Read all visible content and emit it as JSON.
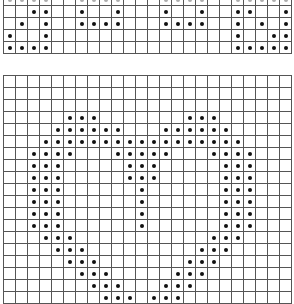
{
  "colors": {
    "grid_line": "#555555",
    "dot": "#111111",
    "background": "#ffffff"
  },
  "top_grid": {
    "columns": 24,
    "rows_visible": 5,
    "cell_size_px": 12,
    "filled_cells": [
      [
        0,
        0
      ],
      [
        0,
        1
      ],
      [
        0,
        2
      ],
      [
        0,
        3
      ],
      [
        0,
        6
      ],
      [
        0,
        7
      ],
      [
        0,
        8
      ],
      [
        0,
        9
      ],
      [
        0,
        13
      ],
      [
        0,
        14
      ],
      [
        0,
        15
      ],
      [
        0,
        16
      ],
      [
        0,
        19
      ],
      [
        0,
        20
      ],
      [
        0,
        21
      ],
      [
        0,
        22
      ],
      [
        0,
        23
      ],
      [
        1,
        2
      ],
      [
        1,
        3
      ],
      [
        1,
        6
      ],
      [
        1,
        9
      ],
      [
        1,
        13
      ],
      [
        1,
        16
      ],
      [
        1,
        19
      ],
      [
        1,
        20
      ],
      [
        1,
        23
      ],
      [
        2,
        1
      ],
      [
        2,
        3
      ],
      [
        2,
        6
      ],
      [
        2,
        7
      ],
      [
        2,
        8
      ],
      [
        2,
        9
      ],
      [
        2,
        13
      ],
      [
        2,
        14
      ],
      [
        2,
        15
      ],
      [
        2,
        16
      ],
      [
        2,
        19
      ],
      [
        2,
        21
      ],
      [
        2,
        23
      ],
      [
        3,
        0
      ],
      [
        3,
        3
      ],
      [
        3,
        19
      ],
      [
        3,
        22
      ],
      [
        3,
        23
      ],
      [
        4,
        0
      ],
      [
        4,
        1
      ],
      [
        4,
        2
      ],
      [
        4,
        3
      ],
      [
        4,
        19
      ],
      [
        4,
        20
      ],
      [
        4,
        21
      ],
      [
        4,
        22
      ],
      [
        4,
        23
      ]
    ]
  },
  "bottom_grid": {
    "columns": 24,
    "rows_visible": 19,
    "cell_size_px": 12,
    "pattern": "heart",
    "filled_cells": [
      [
        3,
        5
      ],
      [
        3,
        6
      ],
      [
        3,
        7
      ],
      [
        3,
        15
      ],
      [
        3,
        16
      ],
      [
        3,
        17
      ],
      [
        4,
        4
      ],
      [
        4,
        5
      ],
      [
        4,
        6
      ],
      [
        4,
        7
      ],
      [
        4,
        8
      ],
      [
        4,
        9
      ],
      [
        4,
        13
      ],
      [
        4,
        14
      ],
      [
        4,
        15
      ],
      [
        4,
        16
      ],
      [
        4,
        17
      ],
      [
        4,
        18
      ],
      [
        5,
        3
      ],
      [
        5,
        4
      ],
      [
        5,
        5
      ],
      [
        5,
        6
      ],
      [
        5,
        7
      ],
      [
        5,
        8
      ],
      [
        5,
        9
      ],
      [
        5,
        10
      ],
      [
        5,
        11
      ],
      [
        5,
        12
      ],
      [
        5,
        13
      ],
      [
        5,
        14
      ],
      [
        5,
        15
      ],
      [
        5,
        16
      ],
      [
        5,
        17
      ],
      [
        5,
        18
      ],
      [
        5,
        19
      ],
      [
        6,
        2
      ],
      [
        6,
        3
      ],
      [
        6,
        4
      ],
      [
        6,
        5
      ],
      [
        6,
        9
      ],
      [
        6,
        10
      ],
      [
        6,
        11
      ],
      [
        6,
        12
      ],
      [
        6,
        13
      ],
      [
        6,
        17
      ],
      [
        6,
        18
      ],
      [
        6,
        19
      ],
      [
        6,
        20
      ],
      [
        7,
        2
      ],
      [
        7,
        3
      ],
      [
        7,
        4
      ],
      [
        7,
        10
      ],
      [
        7,
        11
      ],
      [
        7,
        12
      ],
      [
        7,
        18
      ],
      [
        7,
        19
      ],
      [
        7,
        20
      ],
      [
        8,
        2
      ],
      [
        8,
        3
      ],
      [
        8,
        4
      ],
      [
        8,
        10
      ],
      [
        8,
        11
      ],
      [
        8,
        12
      ],
      [
        8,
        18
      ],
      [
        8,
        19
      ],
      [
        8,
        20
      ],
      [
        9,
        2
      ],
      [
        9,
        3
      ],
      [
        9,
        4
      ],
      [
        9,
        11
      ],
      [
        9,
        18
      ],
      [
        9,
        19
      ],
      [
        9,
        20
      ],
      [
        10,
        2
      ],
      [
        10,
        3
      ],
      [
        10,
        4
      ],
      [
        10,
        11
      ],
      [
        10,
        18
      ],
      [
        10,
        19
      ],
      [
        10,
        20
      ],
      [
        11,
        2
      ],
      [
        11,
        3
      ],
      [
        11,
        4
      ],
      [
        11,
        11
      ],
      [
        11,
        18
      ],
      [
        11,
        19
      ],
      [
        11,
        20
      ],
      [
        12,
        2
      ],
      [
        12,
        3
      ],
      [
        12,
        4
      ],
      [
        12,
        11
      ],
      [
        12,
        18
      ],
      [
        12,
        19
      ],
      [
        12,
        20
      ],
      [
        13,
        3
      ],
      [
        13,
        4
      ],
      [
        13,
        5
      ],
      [
        13,
        17
      ],
      [
        13,
        18
      ],
      [
        13,
        19
      ],
      [
        14,
        4
      ],
      [
        14,
        5
      ],
      [
        14,
        6
      ],
      [
        14,
        16
      ],
      [
        14,
        17
      ],
      [
        14,
        18
      ],
      [
        15,
        5
      ],
      [
        15,
        6
      ],
      [
        15,
        7
      ],
      [
        15,
        15
      ],
      [
        15,
        16
      ],
      [
        15,
        17
      ],
      [
        16,
        6
      ],
      [
        16,
        7
      ],
      [
        16,
        8
      ],
      [
        16,
        14
      ],
      [
        16,
        15
      ],
      [
        16,
        16
      ],
      [
        17,
        7
      ],
      [
        17,
        8
      ],
      [
        17,
        9
      ],
      [
        17,
        13
      ],
      [
        17,
        14
      ],
      [
        17,
        15
      ],
      [
        18,
        8
      ],
      [
        18,
        9
      ],
      [
        18,
        10
      ],
      [
        18,
        12
      ],
      [
        18,
        13
      ],
      [
        18,
        14
      ]
    ]
  }
}
